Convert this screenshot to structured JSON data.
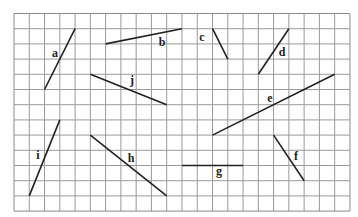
{
  "diagram": {
    "grid": {
      "origin_x": 14,
      "origin_y": 13.5,
      "cell": 15.27,
      "cell_y": 15.2,
      "cols": 22,
      "rows": 13,
      "line_color": "#9a9a9a",
      "border_color": "#8a8a8a"
    },
    "segment_color": "#222222",
    "segments": [
      {
        "label": "a",
        "from": [
          4,
          1
        ],
        "to": [
          2,
          5
        ],
        "label_pos": [
          55,
          57
        ]
      },
      {
        "label": "b",
        "from": [
          6,
          2
        ],
        "to": [
          11,
          1
        ],
        "label_pos": [
          162,
          46
        ]
      },
      {
        "label": "c",
        "from": [
          13,
          1
        ],
        "to": [
          14,
          3
        ],
        "label_pos": [
          202,
          41
        ]
      },
      {
        "label": "d",
        "from": [
          18,
          1
        ],
        "to": [
          16,
          4
        ],
        "label_pos": [
          282,
          56
        ]
      },
      {
        "label": "e",
        "from": [
          13,
          8
        ],
        "to": [
          21,
          4
        ],
        "label_pos": [
          270,
          102
        ]
      },
      {
        "label": "f",
        "from": [
          17,
          8
        ],
        "to": [
          19,
          11
        ],
        "label_pos": [
          296,
          160
        ]
      },
      {
        "label": "g",
        "from": [
          11,
          10
        ],
        "to": [
          15,
          10
        ],
        "label_pos": [
          219,
          175
        ]
      },
      {
        "label": "h",
        "from": [
          5,
          8
        ],
        "to": [
          10,
          12
        ],
        "label_pos": [
          131,
          162
        ]
      },
      {
        "label": "i",
        "from": [
          3,
          7
        ],
        "to": [
          1,
          12
        ],
        "label_pos": [
          38,
          159
        ]
      },
      {
        "label": "j",
        "from": [
          5,
          4
        ],
        "to": [
          10,
          6
        ],
        "label_pos": [
          132,
          84
        ]
      }
    ]
  }
}
